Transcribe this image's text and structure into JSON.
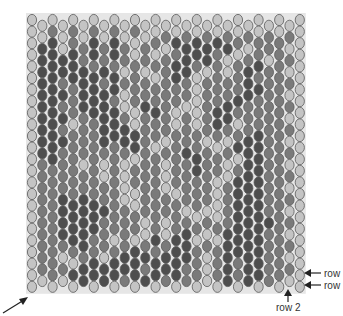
{
  "diagram": {
    "colors": {
      "L": "#c4c4c4",
      "M": "#7a7a7a",
      "D": "#4e4e4e",
      "outline": "#5a5a5a",
      "thread": "#8c8c8c"
    },
    "grid": {
      "origin_x": 32,
      "origin_y": 20,
      "col_spacing": 10.3,
      "row_spacing": 11.6,
      "bead_rx": 4.6,
      "bead_ry": 5.6,
      "columns": 27,
      "rows": 24
    },
    "rows": [
      "LLLLLLLLLLLLLLLLLLLLLLLLLLL",
      "LLMLMLMLMLMLLMLMLMLMLMLMLML",
      "LDDLMMDMDMLMMLDDDDDDMLMMMLL",
      "LDDDDMDMDMLMLMMDDDMLLMMLMML",
      "LDDDDDMDMLMLMMDDMLMLMDDMMLL",
      "LDDMDDDMDMMMLMDMLMMMMDMMMML",
      "LDDDMDDDDLMMMMMMLMMMMDDMMLL",
      "LDDMMDDDMLMDMMMLLMMDDMMMMML",
      "LDDDMMDDDMLMDMLMLMDDMMMMMLL",
      "LDDMLMMDDDLMMMLMLMDMLMMMMML",
      "LDDDMMMDDDDMMLMMMLMLMDDMMLL",
      "LDDMMMMMMMDMLMMDMMLMDDDMMML",
      "LMDMMLMLMLLMMLMMDMMLLDDMMLL",
      "LMMMMMMLMLMMMLMMDMMLMDDMMML",
      "LMMMMMMMMLMMMLMMMMLMDDDMMLL",
      "LMMDMDMMMLLMMMLMMMLMDDDMMML",
      "LMMDDDDDMMLMMMMLMLLMDDDMMLL",
      "LMMDDDDMMMMLMLMMLMLMDDDDMML",
      "LMMDDDDMMMMLMLMDMLMDDDDMMLL",
      "LMMMDDMMLMLMDMDDLMLDDDDMMML",
      "LMMLMMMLMDDDMDDDMLMDDDDMMLL",
      "LMMMLDDDDDDMDDDMMLMDMDDMMML",
      "LLMLDDDDDMDDDMDMMLMDMDDMMLL",
      "LLLLLLLLLLLLLLLLLLLLLLLLLLL"
    ],
    "labels": {
      "row_right_top": "row",
      "row_right_bottom": "row",
      "row_bottom": "row 2"
    }
  }
}
